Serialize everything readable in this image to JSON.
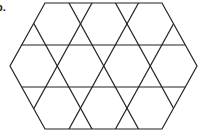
{
  "figure": {
    "label": "b.",
    "stroke_color": "#222222",
    "stroke_width": 1.2,
    "hexagon": [
      [
        45,
        3
      ],
      [
        162,
        3
      ],
      [
        197,
        66
      ],
      [
        162,
        129
      ],
      [
        45,
        129
      ],
      [
        10,
        66
      ]
    ],
    "horizontal_lines_y": [
      45,
      87
    ],
    "diag_down_right_top_x": [
      22.5,
      69,
      115.5
    ],
    "diag_down_left_top_x": [
      92,
      138.5,
      185
    ],
    "diag_dx_per_height": 69.5,
    "top_y": 3,
    "bottom_y": 129
  }
}
